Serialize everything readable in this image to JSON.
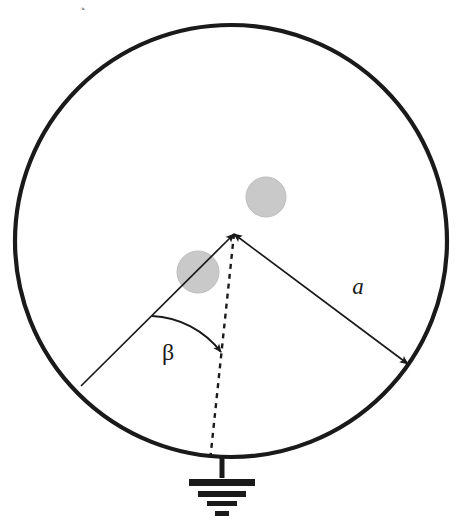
{
  "figure": {
    "type": "geometric-diagram",
    "background_color": "#ffffff",
    "stroke_color": "#1a1a1a",
    "shaded_fill_color": "#c9c9c9",
    "shaded_stroke_color": "#bdbdbd"
  },
  "outer_circle": {
    "name": "outer-boundary-circle",
    "center_x": 231,
    "center_y": 241,
    "radius": 216,
    "stroke_width": 4.2,
    "fill": "none"
  },
  "apex": {
    "name": "apex-vertex",
    "x": 234,
    "y": 234
  },
  "radius_vector_a": {
    "label": "a",
    "from_x": 408,
    "from_y": 364,
    "to_x": 234,
    "to_y": 234,
    "label_x": 358,
    "label_y": 294,
    "font_size": 23,
    "stroke_width": 1.7,
    "double_headed": true
  },
  "radius_vector_left": {
    "name": "left-radius-vector",
    "from_x": 81,
    "from_y": 386,
    "to_x": 234,
    "to_y": 234,
    "stroke_width": 1.7,
    "double_headed": false
  },
  "dashed_reference_line": {
    "name": "dashed-reference-radius",
    "from_x": 234,
    "from_y": 234,
    "to_x": 210,
    "to_y": 461,
    "stroke_width": 2.4,
    "dash_pattern": "5 5"
  },
  "angle_arc": {
    "label": "β",
    "label_x": 168,
    "label_y": 360,
    "font_size": 24,
    "arc_start_x": 152,
    "arc_start_y": 316,
    "arc_end_x": 221,
    "arc_end_y": 352,
    "arc_radius": 92,
    "stroke_width": 1.9
  },
  "shaded_inclusions": [
    {
      "name": "shaded-inclusion-upper",
      "cx": 266,
      "cy": 197,
      "r": 20
    },
    {
      "name": "shaded-inclusion-lower",
      "cx": 198,
      "cy": 272,
      "r": 21
    }
  ],
  "ground_symbol": {
    "name": "ground-symbol",
    "stem_x": 222,
    "stem_top_y": 457,
    "stem_bottom_y": 478,
    "stem_width": 5,
    "bars": [
      {
        "half_width": 33,
        "y": 479,
        "thickness": 7
      },
      {
        "half_width": 24,
        "y": 491,
        "thickness": 6
      },
      {
        "half_width": 15,
        "y": 501,
        "thickness": 5
      },
      {
        "half_width": 7,
        "y": 511,
        "thickness": 5
      }
    ]
  },
  "artifact_glyph": {
    "name": "cropped-glyph-artifact",
    "x": 82,
    "y": 2,
    "text": "◔",
    "font_size": 11,
    "opacity": 0.5
  }
}
